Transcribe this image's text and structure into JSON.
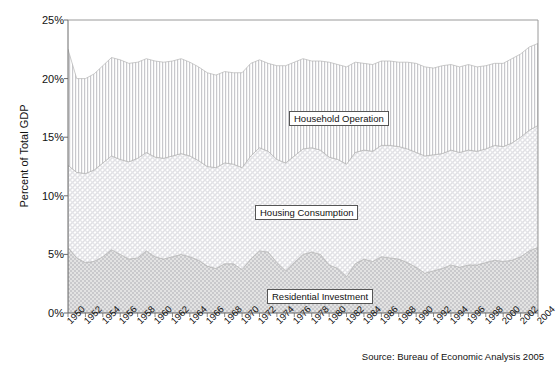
{
  "chart_data": {
    "type": "area",
    "title": "",
    "subtitle": "",
    "xlabel": "",
    "ylabel": "Percent of Total GDP",
    "ylim": [
      0,
      25
    ],
    "ytick_labels": [
      "0%",
      "5%",
      "10%",
      "15%",
      "20%",
      "25%"
    ],
    "ytick_values": [
      0,
      5,
      10,
      15,
      20,
      25
    ],
    "grid": false,
    "legend_position": "inline-annotations",
    "stacked": true,
    "source_note": "Source: Bureau of Economic Analysis 2005",
    "x": [
      1950,
      1951,
      1952,
      1953,
      1954,
      1955,
      1956,
      1957,
      1958,
      1959,
      1960,
      1961,
      1962,
      1963,
      1964,
      1965,
      1966,
      1967,
      1968,
      1969,
      1970,
      1971,
      1972,
      1973,
      1974,
      1975,
      1976,
      1977,
      1978,
      1979,
      1980,
      1981,
      1982,
      1983,
      1984,
      1985,
      1986,
      1987,
      1988,
      1989,
      1990,
      1991,
      1992,
      1993,
      1994,
      1995,
      1996,
      1997,
      1998,
      1999,
      2000,
      2001,
      2002,
      2003,
      2004
    ],
    "xtick_labels": [
      "1950",
      "1952",
      "1954",
      "1956",
      "1958",
      "1960",
      "1962",
      "1964",
      "1966",
      "1968",
      "1970",
      "1972",
      "1974",
      "1976",
      "1978",
      "1980",
      "1982",
      "1984",
      "1986",
      "1988",
      "1990",
      "1992",
      "1994",
      "1996",
      "1998",
      "2000",
      "2002",
      "2004"
    ],
    "series": [
      {
        "name": "Residential Investment",
        "fill_pattern": "stipple-checker",
        "color": "#cfcfcf",
        "values": [
          5.6,
          4.7,
          4.3,
          4.4,
          4.8,
          5.4,
          5.0,
          4.6,
          4.7,
          5.3,
          4.8,
          4.6,
          4.8,
          5.0,
          4.8,
          4.5,
          4.0,
          3.8,
          4.2,
          4.2,
          3.7,
          4.6,
          5.3,
          5.2,
          4.3,
          3.6,
          4.3,
          5.0,
          5.2,
          5.0,
          4.1,
          3.8,
          3.1,
          4.2,
          4.6,
          4.4,
          4.8,
          4.7,
          4.6,
          4.3,
          3.9,
          3.4,
          3.6,
          3.8,
          4.1,
          3.9,
          4.1,
          4.1,
          4.3,
          4.5,
          4.4,
          4.5,
          4.8,
          5.3,
          5.6
        ]
      },
      {
        "name": "Housing Consumption",
        "fill_pattern": "cross-hatch",
        "color": "#e6e6e6",
        "values": [
          7.0,
          7.3,
          7.6,
          7.8,
          8.0,
          8.0,
          8.1,
          8.3,
          8.5,
          8.4,
          8.5,
          8.6,
          8.6,
          8.6,
          8.6,
          8.5,
          8.5,
          8.6,
          8.6,
          8.5,
          8.7,
          8.8,
          8.8,
          8.6,
          8.8,
          9.2,
          9.1,
          9.0,
          8.9,
          8.9,
          9.2,
          9.3,
          9.6,
          9.5,
          9.3,
          9.4,
          9.5,
          9.6,
          9.6,
          9.7,
          9.8,
          10.0,
          9.9,
          9.8,
          9.8,
          9.8,
          9.8,
          9.7,
          9.7,
          9.8,
          9.8,
          10.0,
          10.2,
          10.3,
          10.4
        ]
      },
      {
        "name": "Household Operation",
        "fill_pattern": "vertical-lines",
        "color": "#dcdcdc",
        "values": [
          9.9,
          8.0,
          8.1,
          8.2,
          8.3,
          8.4,
          8.5,
          8.4,
          8.2,
          8.0,
          8.2,
          8.2,
          8.1,
          8.1,
          8.0,
          8.0,
          8.0,
          7.9,
          7.8,
          7.8,
          8.1,
          7.9,
          7.5,
          7.5,
          8.0,
          8.3,
          8.0,
          7.7,
          7.4,
          7.6,
          8.1,
          8.1,
          8.3,
          7.7,
          7.4,
          7.4,
          7.2,
          7.2,
          7.2,
          7.4,
          7.6,
          7.6,
          7.4,
          7.5,
          7.3,
          7.3,
          7.3,
          7.2,
          7.1,
          7.0,
          7.1,
          7.2,
          7.1,
          7.1,
          7.0
        ]
      }
    ],
    "annotations": [
      {
        "text": "Household Operation",
        "x": 1973,
        "y": 15.0
      },
      {
        "text": "Housing Consumption",
        "x": 1968,
        "y": 8.2
      },
      {
        "text": "Residential Investment",
        "x": 1970,
        "y": 1.5
      }
    ]
  }
}
